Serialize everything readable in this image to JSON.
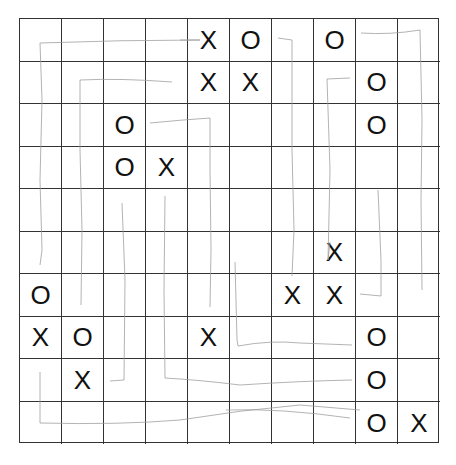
{
  "game": {
    "type": "gomoku-grid",
    "rows": 10,
    "cols": 10,
    "board": [
      [
        "",
        "",
        "",
        "",
        "X",
        "O",
        "",
        "O",
        "",
        ""
      ],
      [
        "",
        "",
        "",
        "",
        "X",
        "X",
        "",
        "",
        "O",
        ""
      ],
      [
        "",
        "",
        "O",
        "",
        "",
        "",
        "",
        "",
        "O",
        ""
      ],
      [
        "",
        "",
        "O",
        "X",
        "",
        "",
        "",
        "",
        "",
        ""
      ],
      [
        "",
        "",
        "",
        "",
        "",
        "",
        "",
        "",
        "",
        ""
      ],
      [
        "",
        "",
        "",
        "",
        "",
        "",
        "",
        "X",
        "",
        ""
      ],
      [
        "O",
        "",
        "",
        "",
        "",
        "",
        "X",
        "X",
        "",
        ""
      ],
      [
        "X",
        "O",
        "",
        "",
        "X",
        "",
        "",
        "",
        "O",
        ""
      ],
      [
        "",
        "X",
        "",
        "",
        "",
        "",
        "",
        "",
        "O",
        ""
      ],
      [
        "",
        "",
        "",
        "",
        "",
        "",
        "",
        "",
        "O",
        "X"
      ]
    ],
    "colors": {
      "grid": "#333333",
      "marks": "#111111",
      "pencil": "#9a9a9a"
    }
  }
}
